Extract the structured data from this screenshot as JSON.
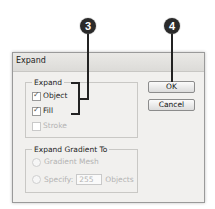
{
  "callouts": [
    {
      "number": "3",
      "target": "Expand checkboxes"
    },
    {
      "number": "4",
      "target": "OK button"
    }
  ],
  "dialog": {
    "title": "Expand",
    "expand_group": {
      "label": "Expand",
      "options": [
        {
          "label": "Object",
          "checked": true,
          "enabled": true
        },
        {
          "label": "Fill",
          "checked": true,
          "enabled": true
        },
        {
          "label": "Stroke",
          "checked": false,
          "enabled": false
        }
      ]
    },
    "gradient_group": {
      "label": "Expand Gradient To",
      "options": [
        {
          "label": "Gradient Mesh",
          "enabled": false
        },
        {
          "label": "Specify:",
          "enabled": false
        }
      ],
      "specify_value": "255",
      "specify_suffix": "Objects"
    },
    "buttons": {
      "ok": "OK",
      "cancel": "Cancel"
    }
  }
}
